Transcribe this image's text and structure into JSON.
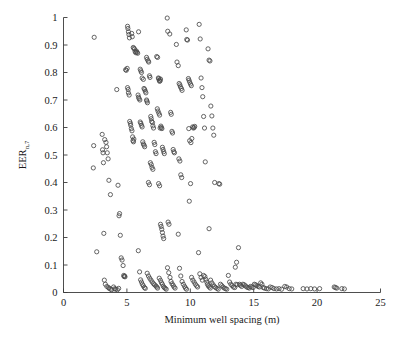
{
  "chart_data": {
    "type": "scatter",
    "title": "",
    "xlabel": "Minimum well spacing (m)",
    "ylabel": "EER",
    "ylabel_subscript": "n,7",
    "xlim": [
      0,
      25
    ],
    "ylim": [
      0,
      1
    ],
    "xticks": [
      "0",
      "5",
      "10",
      "15",
      "20",
      "25"
    ],
    "xtick_values": [
      0,
      5,
      10,
      15,
      20,
      25
    ],
    "yticks": [
      "0",
      "0.1",
      "0.2",
      "0.3",
      "0.4",
      "0.5",
      "0.6",
      "0.7",
      "0.8",
      "0.9",
      "1"
    ],
    "ytick_values": [
      0,
      0.1,
      0.2,
      0.3,
      0.4,
      0.5,
      0.6,
      0.7,
      0.8,
      0.9,
      1
    ],
    "grid": false,
    "legend": null,
    "marker": "open-circle",
    "marker_color": "#4a4a4a",
    "marker_size": 4.2,
    "points": [
      [
        2.42,
        0.928
      ],
      [
        2.38,
        0.534
      ],
      [
        2.35,
        0.453
      ],
      [
        2.62,
        0.148
      ],
      [
        3.05,
        0.575
      ],
      [
        3.08,
        0.519
      ],
      [
        3.12,
        0.508
      ],
      [
        3.15,
        0.472
      ],
      [
        3.18,
        0.215
      ],
      [
        3.22,
        0.045
      ],
      [
        3.3,
        0.03
      ],
      [
        3.42,
        0.022
      ],
      [
        3.55,
        0.018
      ],
      [
        3.6,
        0.015
      ],
      [
        3.72,
        0.012
      ],
      [
        3.8,
        0.01
      ],
      [
        3.25,
        0.556
      ],
      [
        3.35,
        0.546
      ],
      [
        3.4,
        0.53
      ],
      [
        3.45,
        0.508
      ],
      [
        3.52,
        0.486
      ],
      [
        3.58,
        0.408
      ],
      [
        3.7,
        0.356
      ],
      [
        3.95,
        0.02
      ],
      [
        4.05,
        0.014
      ],
      [
        4.12,
        0.012
      ],
      [
        4.25,
        0.01
      ],
      [
        4.35,
        0.015
      ],
      [
        4.2,
        0.738
      ],
      [
        4.3,
        0.39
      ],
      [
        4.38,
        0.279
      ],
      [
        4.42,
        0.287
      ],
      [
        4.48,
        0.208
      ],
      [
        4.55,
        0.126
      ],
      [
        4.62,
        0.118
      ],
      [
        4.7,
        0.098
      ],
      [
        4.75,
        0.062
      ],
      [
        4.78,
        0.058
      ],
      [
        4.82,
        0.06
      ],
      [
        4.85,
        0.057
      ],
      [
        4.9,
        0.81
      ],
      [
        4.95,
        0.808
      ],
      [
        5.02,
        0.815
      ],
      [
        5.05,
        0.745
      ],
      [
        5.1,
        0.738
      ],
      [
        5.12,
        0.726
      ],
      [
        5.18,
        0.718
      ],
      [
        5.22,
        0.622
      ],
      [
        5.28,
        0.615
      ],
      [
        5.3,
        0.608
      ],
      [
        5.35,
        0.596
      ],
      [
        5.4,
        0.588
      ],
      [
        5.45,
        0.566
      ],
      [
        5.48,
        0.552
      ],
      [
        5.52,
        0.548
      ],
      [
        5.55,
        0.558
      ],
      [
        5.08,
        0.96
      ],
      [
        5.12,
        0.948
      ],
      [
        5.16,
        0.938
      ],
      [
        5.2,
        0.926
      ],
      [
        5.05,
        0.968
      ],
      [
        5.38,
        0.942
      ],
      [
        5.42,
        0.93
      ],
      [
        5.5,
        0.891
      ],
      [
        5.55,
        0.888
      ],
      [
        5.6,
        0.885
      ],
      [
        5.65,
        0.876
      ],
      [
        5.7,
        0.872
      ],
      [
        5.75,
        0.878
      ],
      [
        5.8,
        0.873
      ],
      [
        5.85,
        0.87
      ],
      [
        5.92,
        0.948
      ],
      [
        5.88,
        0.718
      ],
      [
        5.92,
        0.71
      ],
      [
        5.96,
        0.705
      ],
      [
        6.02,
        0.7
      ],
      [
        6.05,
        0.62
      ],
      [
        6.1,
        0.615
      ],
      [
        6.15,
        0.608
      ],
      [
        6.2,
        0.602
      ],
      [
        6.25,
        0.548
      ],
      [
        6.3,
        0.54
      ],
      [
        6.35,
        0.536
      ],
      [
        6.4,
        0.53
      ],
      [
        6.05,
        0.812
      ],
      [
        6.1,
        0.806
      ],
      [
        6.15,
        0.8
      ],
      [
        6.2,
        0.78
      ],
      [
        6.3,
        0.775
      ],
      [
        6.35,
        0.742
      ],
      [
        6.4,
        0.738
      ],
      [
        6.45,
        0.732
      ],
      [
        6.5,
        0.726
      ],
      [
        6.55,
        0.7
      ],
      [
        6.58,
        0.696
      ],
      [
        6.62,
        0.69
      ],
      [
        5.9,
        0.152
      ],
      [
        6.0,
        0.075
      ],
      [
        6.08,
        0.046
      ],
      [
        6.15,
        0.038
      ],
      [
        6.22,
        0.03
      ],
      [
        6.3,
        0.024
      ],
      [
        6.38,
        0.018
      ],
      [
        6.45,
        0.015
      ],
      [
        6.55,
        0.855
      ],
      [
        6.6,
        0.848
      ],
      [
        6.68,
        0.842
      ],
      [
        6.72,
        0.838
      ],
      [
        6.78,
        0.788
      ],
      [
        6.82,
        0.782
      ],
      [
        6.88,
        0.64
      ],
      [
        6.92,
        0.632
      ],
      [
        6.95,
        0.622
      ],
      [
        7.02,
        0.618
      ],
      [
        7.05,
        0.606
      ],
      [
        7.1,
        0.598
      ],
      [
        7.15,
        0.546
      ],
      [
        7.2,
        0.538
      ],
      [
        7.25,
        0.512
      ],
      [
        7.3,
        0.505
      ],
      [
        6.7,
        0.4
      ],
      [
        6.78,
        0.392
      ],
      [
        6.85,
        0.472
      ],
      [
        6.92,
        0.465
      ],
      [
        6.98,
        0.455
      ],
      [
        7.05,
        0.448
      ],
      [
        6.6,
        0.07
      ],
      [
        6.7,
        0.06
      ],
      [
        6.8,
        0.052
      ],
      [
        6.9,
        0.045
      ],
      [
        7.0,
        0.038
      ],
      [
        7.1,
        0.032
      ],
      [
        7.18,
        0.028
      ],
      [
        7.28,
        0.024
      ],
      [
        7.35,
        0.02
      ],
      [
        7.42,
        0.016
      ],
      [
        7.35,
        0.858
      ],
      [
        7.42,
        0.855
      ],
      [
        7.48,
        0.78
      ],
      [
        7.52,
        0.778
      ],
      [
        7.55,
        0.772
      ],
      [
        7.58,
        0.768
      ],
      [
        7.62,
        0.77
      ],
      [
        7.65,
        0.776
      ],
      [
        7.4,
        0.668
      ],
      [
        7.45,
        0.66
      ],
      [
        7.52,
        0.652
      ],
      [
        7.58,
        0.645
      ],
      [
        7.62,
        0.598
      ],
      [
        7.68,
        0.605
      ],
      [
        7.72,
        0.6
      ],
      [
        7.76,
        0.596
      ],
      [
        7.8,
        0.528
      ],
      [
        7.85,
        0.52
      ],
      [
        7.9,
        0.512
      ],
      [
        7.95,
        0.505
      ],
      [
        7.5,
        0.396
      ],
      [
        7.58,
        0.388
      ],
      [
        7.65,
        0.248
      ],
      [
        7.7,
        0.24
      ],
      [
        7.75,
        0.23
      ],
      [
        7.8,
        0.218
      ],
      [
        7.85,
        0.205
      ],
      [
        7.9,
        0.196
      ],
      [
        7.55,
        0.052
      ],
      [
        7.65,
        0.044
      ],
      [
        7.72,
        0.036
      ],
      [
        7.8,
        0.03
      ],
      [
        7.88,
        0.022
      ],
      [
        7.95,
        0.018
      ],
      [
        8.02,
        0.015
      ],
      [
        8.1,
        0.012
      ],
      [
        8.18,
        0.998
      ],
      [
        8.22,
        0.95
      ],
      [
        8.38,
        0.94
      ],
      [
        8.45,
        0.655
      ],
      [
        8.5,
        0.648
      ],
      [
        8.55,
        0.586
      ],
      [
        8.6,
        0.58
      ],
      [
        8.65,
        0.52
      ],
      [
        8.7,
        0.512
      ],
      [
        8.75,
        0.508
      ],
      [
        8.25,
        0.256
      ],
      [
        8.32,
        0.248
      ],
      [
        8.2,
        0.09
      ],
      [
        8.3,
        0.072
      ],
      [
        8.4,
        0.055
      ],
      [
        8.48,
        0.04
      ],
      [
        8.56,
        0.032
      ],
      [
        8.65,
        0.026
      ],
      [
        8.72,
        0.02
      ],
      [
        8.8,
        0.016
      ],
      [
        8.9,
        0.902
      ],
      [
        8.95,
        0.838
      ],
      [
        9.05,
        0.825
      ],
      [
        9.12,
        0.76
      ],
      [
        9.18,
        0.755
      ],
      [
        9.22,
        0.748
      ],
      [
        9.3,
        0.742
      ],
      [
        9.35,
        0.735
      ],
      [
        9.1,
        0.486
      ],
      [
        9.18,
        0.478
      ],
      [
        9.25,
        0.428
      ],
      [
        9.32,
        0.418
      ],
      [
        9.05,
        0.212
      ],
      [
        9.15,
        0.088
      ],
      [
        9.25,
        0.06
      ],
      [
        9.35,
        0.04
      ],
      [
        9.45,
        0.03
      ],
      [
        9.55,
        0.022
      ],
      [
        9.62,
        0.016
      ],
      [
        9.7,
        0.012
      ],
      [
        9.68,
        0.955
      ],
      [
        9.72,
        0.92
      ],
      [
        9.78,
        0.918
      ],
      [
        9.85,
        0.778
      ],
      [
        9.9,
        0.772
      ],
      [
        9.95,
        0.765
      ],
      [
        10.02,
        0.758
      ],
      [
        10.08,
        0.752
      ],
      [
        9.88,
        0.596
      ],
      [
        9.95,
        0.552
      ],
      [
        10.05,
        0.545
      ],
      [
        10.12,
        0.56
      ],
      [
        10.18,
        0.602
      ],
      [
        10.25,
        0.598
      ],
      [
        10.3,
        0.6
      ],
      [
        10.35,
        0.604
      ],
      [
        9.92,
        0.332
      ],
      [
        10.02,
        0.396
      ],
      [
        10.1,
        0.055
      ],
      [
        10.2,
        0.045
      ],
      [
        10.3,
        0.038
      ],
      [
        10.4,
        0.03
      ],
      [
        10.5,
        0.024
      ],
      [
        10.58,
        0.02
      ],
      [
        10.7,
        0.975
      ],
      [
        10.78,
        0.922
      ],
      [
        10.85,
        0.78
      ],
      [
        10.92,
        0.745
      ],
      [
        10.98,
        0.712
      ],
      [
        11.05,
        0.64
      ],
      [
        11.12,
        0.598
      ],
      [
        11.18,
        0.475
      ],
      [
        10.65,
        0.145
      ],
      [
        10.75,
        0.068
      ],
      [
        10.85,
        0.055
      ],
      [
        10.95,
        0.045
      ],
      [
        11.05,
        0.062
      ],
      [
        11.15,
        0.058
      ],
      [
        11.22,
        0.048
      ],
      [
        11.3,
        0.038
      ],
      [
        11.35,
        0.03
      ],
      [
        11.42,
        0.024
      ],
      [
        11.5,
        0.02
      ],
      [
        11.58,
        0.016
      ],
      [
        11.4,
        0.886
      ],
      [
        11.48,
        0.845
      ],
      [
        11.55,
        0.842
      ],
      [
        11.62,
        0.678
      ],
      [
        11.7,
        0.642
      ],
      [
        11.78,
        0.598
      ],
      [
        11.85,
        0.572
      ],
      [
        11.92,
        0.4
      ],
      [
        11.48,
        0.232
      ],
      [
        11.6,
        0.045
      ],
      [
        11.7,
        0.035
      ],
      [
        11.8,
        0.028
      ],
      [
        11.9,
        0.022
      ],
      [
        12.0,
        0.018
      ],
      [
        12.1,
        0.015
      ],
      [
        12.2,
        0.012
      ],
      [
        12.25,
        0.396
      ],
      [
        12.32,
        0.394
      ],
      [
        12.38,
        0.03
      ],
      [
        12.48,
        0.025
      ],
      [
        12.58,
        0.02
      ],
      [
        12.68,
        0.016
      ],
      [
        12.78,
        0.014
      ],
      [
        12.88,
        0.012
      ],
      [
        13.0,
        0.062
      ],
      [
        13.1,
        0.038
      ],
      [
        13.2,
        0.03
      ],
      [
        13.3,
        0.025
      ],
      [
        13.4,
        0.02
      ],
      [
        13.5,
        0.018
      ],
      [
        13.6,
        0.03
      ],
      [
        13.7,
        0.028
      ],
      [
        13.55,
        0.092
      ],
      [
        13.65,
        0.11
      ],
      [
        13.8,
        0.163
      ],
      [
        13.88,
        0.03
      ],
      [
        13.95,
        0.026
      ],
      [
        14.05,
        0.022
      ],
      [
        14.15,
        0.03
      ],
      [
        14.25,
        0.028
      ],
      [
        14.35,
        0.024
      ],
      [
        14.45,
        0.02
      ],
      [
        14.55,
        0.018
      ],
      [
        14.65,
        0.016
      ],
      [
        14.75,
        0.022
      ],
      [
        14.85,
        0.02
      ],
      [
        14.95,
        0.018
      ],
      [
        15.05,
        0.03
      ],
      [
        15.15,
        0.028
      ],
      [
        15.25,
        0.025
      ],
      [
        15.35,
        0.022
      ],
      [
        15.45,
        0.02
      ],
      [
        15.55,
        0.035
      ],
      [
        15.65,
        0.03
      ],
      [
        15.75,
        0.018
      ],
      [
        15.85,
        0.016
      ],
      [
        16.0,
        0.014
      ],
      [
        16.15,
        0.013
      ],
      [
        16.3,
        0.02
      ],
      [
        16.45,
        0.018
      ],
      [
        16.6,
        0.014
      ],
      [
        16.8,
        0.013
      ],
      [
        17.0,
        0.014
      ],
      [
        17.2,
        0.012
      ],
      [
        17.45,
        0.022
      ],
      [
        17.6,
        0.02
      ],
      [
        17.8,
        0.014
      ],
      [
        18.0,
        0.013
      ],
      [
        18.9,
        0.014
      ],
      [
        19.2,
        0.013
      ],
      [
        19.5,
        0.014
      ],
      [
        19.8,
        0.013
      ],
      [
        20.2,
        0.014
      ],
      [
        21.35,
        0.02
      ],
      [
        21.45,
        0.018
      ],
      [
        21.55,
        0.016
      ],
      [
        21.95,
        0.014
      ],
      [
        22.15,
        0.013
      ]
    ]
  }
}
